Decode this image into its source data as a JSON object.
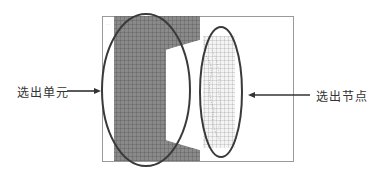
{
  "labels": {
    "left": "选出单元",
    "right": "选出节点"
  },
  "colors": {
    "mesh_dark": "#7a7a7a",
    "mesh_line": "#5a5a5a",
    "mesh_light_bg": "#f2f2f2",
    "mesh_light_line": "#8a8a8a",
    "ellipse": "#3a3a3a",
    "arrow": "#333333",
    "frame": "#9a9a9a"
  }
}
